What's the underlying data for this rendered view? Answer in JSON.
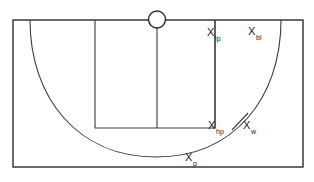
{
  "figure": {
    "name": "basketball-half-court-dimension-diagram",
    "type": "line-drawing",
    "background_color": "#ffffff",
    "line_color": "#2b2b2b",
    "width": 314,
    "height": 182
  },
  "labels": [
    {
      "id": "lp",
      "base": "X",
      "subscript": "lp",
      "text": "X lp"
    },
    {
      "id": "bl",
      "base": "X",
      "subscript": "bl",
      "text": "X bl"
    },
    {
      "id": "hp",
      "base": "X",
      "subscript": "hp",
      "text": "X hp"
    },
    {
      "id": "w",
      "base": "X",
      "subscript": "w",
      "text": "X w"
    },
    {
      "id": "p",
      "base": "X",
      "subscript": "p",
      "text": "X p"
    }
  ],
  "geometry": {
    "outer_rect": {
      "x": 13,
      "y": 20,
      "width": 290,
      "height": 147
    },
    "key_rect": {
      "x": 95,
      "y": 20,
      "width": 120,
      "height": 108
    },
    "center_line": {
      "x": 157,
      "y1": 28,
      "y2": 128
    },
    "hoop_circle": {
      "cx": 157,
      "cy": 19.5,
      "r": 8.5
    },
    "free_throw_line_y": 128,
    "three_point_arc": {
      "start_x": 30,
      "start_y": 20,
      "end_x": 281,
      "end_y": 20,
      "bottom_y": 157
    },
    "right_vertical_lp": {
      "x": 215,
      "y1": 20,
      "y2": 128
    }
  }
}
